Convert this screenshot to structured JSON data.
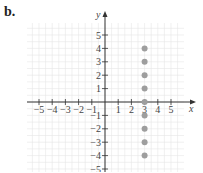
{
  "panel_label": "b.",
  "chart_data": {
    "type": "scatter",
    "title": "",
    "xlabel": "x",
    "ylabel": "y",
    "xlim": [
      -6,
      6
    ],
    "ylim": [
      -5,
      5
    ],
    "grid": true,
    "x_ticks": [
      -5,
      -4,
      -3,
      -2,
      -1,
      1,
      2,
      3,
      4,
      5
    ],
    "y_ticks": [
      5,
      4,
      3,
      2,
      1,
      -1,
      -2,
      -3,
      -4,
      -5
    ],
    "x_tick_labels": [
      "−5",
      "−4",
      "−3",
      "−2",
      "−1",
      "1",
      "2",
      "3",
      "4",
      "5"
    ],
    "y_tick_labels": [
      "5",
      "4",
      "3",
      "2",
      "1",
      "−1",
      "−2",
      "−3",
      "−4",
      "−5"
    ],
    "series": [
      {
        "name": "points",
        "x": [
          3,
          3,
          3,
          3,
          3,
          3,
          3,
          3,
          3
        ],
        "y": [
          4,
          3,
          2,
          1,
          0,
          -1,
          -2,
          -3,
          -4
        ]
      }
    ],
    "colors": {
      "point": "#9e9e9e",
      "axis": "#333333",
      "grid": "#e6e6e6"
    }
  }
}
